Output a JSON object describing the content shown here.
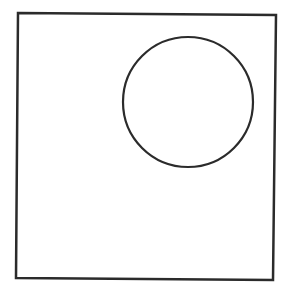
{
  "canvas": {
    "width": 289,
    "height": 297,
    "background": "#ffffff"
  },
  "stroke_color": "#2b2b2b",
  "shapes": {
    "square": {
      "points": "18,13 276,15 273,280 16,278",
      "stroke_width": 2.5
    },
    "circle": {
      "cx": 188,
      "cy": 102,
      "r": 65,
      "stroke_width": 2.2
    }
  }
}
